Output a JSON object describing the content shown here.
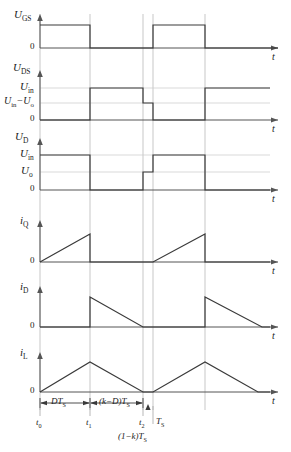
{
  "figure": {
    "colors": {
      "trace": "#3a3a3a",
      "axis": "#555555",
      "gridline": "#b9b9b9",
      "background": "#ffffff"
    },
    "time_axis_label": "t",
    "zero_label": "0"
  },
  "timing": {
    "t0": 40,
    "t1": 90,
    "t2": 143,
    "t3": 153,
    "t4": 205,
    "t5": 258,
    "gridlines": [
      40,
      90,
      143,
      153,
      205
    ],
    "axis_end": 278
  },
  "panels": [
    {
      "id": "ugs",
      "name": "gate-source-voltage",
      "y_label": "U",
      "y_sub": "GS",
      "level_labels": [],
      "baseline": 48,
      "top": 16,
      "waveform_type": "square",
      "description": "High from t0 to t1, low from t1 to t3, high from t3 to t4, low after"
    },
    {
      "id": "uds",
      "name": "drain-source-voltage",
      "y_label": "U",
      "y_sub": "DS",
      "level_labels": [
        {
          "text": "U",
          "sub": "in",
          "value": 88
        },
        {
          "text": "U",
          "sub": "in",
          "suffix": "−U",
          "sub2": "o",
          "value": 103
        }
      ],
      "baseline": 120,
      "waveform_type": "step",
      "description": "Zero until t1, rises to Uin, steps down to Uin-Uo at t2, falls to 0 at t3, rises to Uin at t4"
    },
    {
      "id": "ud",
      "name": "diode-voltage",
      "y_label": "U",
      "y_sub": "D",
      "level_labels": [
        {
          "text": "U",
          "sub": "in",
          "value": 155
        },
        {
          "text": "U",
          "sub": "o",
          "value": 172
        }
      ],
      "baseline": 190,
      "waveform_type": "step",
      "description": "Uin from t0 to t1, 0 from t1 to t2, Uo from t2 to t3, Uin from t3 to t4, 0 after"
    },
    {
      "id": "iq",
      "name": "switch-current",
      "y_label": "i",
      "y_sub": "Q",
      "level_labels": [],
      "baseline": 262,
      "peak": 234,
      "waveform_type": "sawtooth-rising",
      "description": "Ramps up from 0 at t0 to peak at t1, drops to 0, flat until t3, ramps up to peak at t4, drops to 0"
    },
    {
      "id": "id",
      "name": "diode-current",
      "y_label": "i",
      "y_sub": "D",
      "level_labels": [],
      "baseline": 327,
      "peak": 297,
      "waveform_type": "sawtooth-falling",
      "description": "Zero until t1, jumps to peak, ramps down to 0 at t2, flat until t4, jumps to peak, ramps down"
    },
    {
      "id": "il",
      "name": "inductor-current",
      "y_label": "i",
      "y_sub": "L",
      "level_labels": [],
      "baseline": 392,
      "peak": 362,
      "waveform_type": "triangle",
      "description": "Rises from 0 at t0 to peak at t1, falls to 0 at t2, rises to peak at t4, falls to 0 at t5"
    }
  ],
  "annotations": {
    "interval_1": {
      "text": "DT",
      "sub": "S",
      "from": 40,
      "to": 90
    },
    "interval_2": {
      "text": "(k−D)T",
      "sub": "S",
      "from": 90,
      "to": 143
    },
    "period_label": {
      "text": "T",
      "sub": "S"
    },
    "remainder_label": {
      "text": "(1−k)T",
      "sub": "S"
    },
    "tick_labels": [
      {
        "text": "t",
        "sub": "0",
        "x": 40
      },
      {
        "text": "t",
        "sub": "1",
        "x": 90
      },
      {
        "text": "t",
        "sub": "2",
        "x": 143
      }
    ]
  }
}
